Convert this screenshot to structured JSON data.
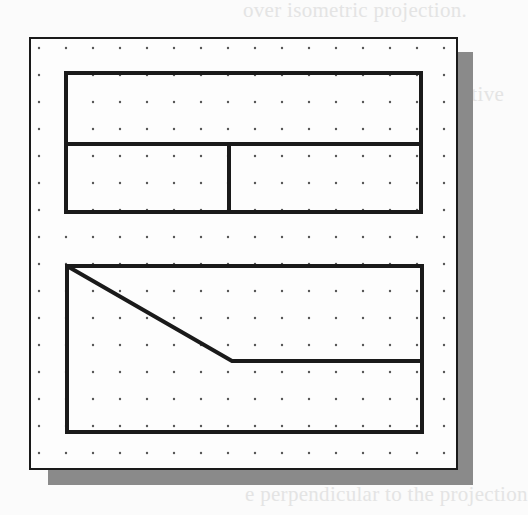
{
  "background_text": [
    {
      "text": "over isometric projection.",
      "x": 243,
      "y": 0
    },
    {
      "text": "ed with a two-point perspective",
      "x": 230,
      "y": 86
    },
    {
      "text": "the geometry via the frontal",
      "x": 228,
      "y": 156
    },
    {
      "text": "",
      "x": 0,
      "y": 0
    },
    {
      "text": "ine",
      "x": 440,
      "y": 405
    },
    {
      "text": "e perpendicular to the projection",
      "x": 245,
      "y": 484
    }
  ],
  "diagram": {
    "colors": {
      "line": "#1a1a1a",
      "dot": "#555555",
      "shadow": "#8a8a8a",
      "sheet": "#fdfdfd"
    },
    "grid": {
      "x0": 39,
      "y0": 48,
      "spacing_x": 27,
      "spacing_y": 27,
      "cols": 16,
      "rows": 16
    },
    "top_view": {
      "x": 66,
      "y": 73,
      "w": 355,
      "h": 139,
      "divider_y": 144,
      "divider_x": 229
    },
    "front_view": {
      "x": 67,
      "y": 266,
      "w": 355,
      "h": 166,
      "diagonal_from": [
        67,
        266
      ],
      "diagonal_to": [
        232,
        361
      ],
      "ledge_y": 361
    }
  }
}
